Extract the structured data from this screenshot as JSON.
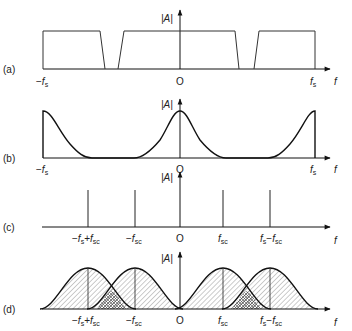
{
  "figure": {
    "panels": [
      {
        "id": "a",
        "label": "(a)",
        "y_label": "|A|",
        "x_label": "f",
        "shape": "trapezoidal passbands repeating at multiples of fs",
        "ticks": [
          "-fs",
          "O",
          "fs"
        ]
      },
      {
        "id": "b",
        "label": "(b)",
        "y_label": "|A|",
        "x_label": "f",
        "shape": "raised-cosine lobes centered at -fs, 0, fs",
        "ticks": [
          "-fs",
          "O",
          "fs"
        ]
      },
      {
        "id": "c",
        "label": "(c)",
        "y_label": "|A|",
        "x_label": "f",
        "shape": "spectral lines",
        "ticks": [
          "-fs+fsc",
          "-fsc",
          "O",
          "fsc",
          "fs-fsc"
        ]
      },
      {
        "id": "d",
        "label": "(d)",
        "y_label": "|A|",
        "x_label": "f",
        "shape": "hatched lobes centered on spectral lines with cross-hatched overlaps",
        "ticks": [
          "-fs+fsc",
          "-fsc",
          "O",
          "fsc",
          "fs-fsc"
        ]
      }
    ],
    "text": {
      "a_label": "(a)",
      "b_label": "(b)",
      "c_label": "(c)",
      "d_label": "(d)",
      "abs_A": "|A|",
      "f": "f",
      "origin": "O",
      "minus": "−",
      "plus": "+",
      "f_sym": "f",
      "s_sub": "s",
      "sc_sub": "sc"
    }
  }
}
